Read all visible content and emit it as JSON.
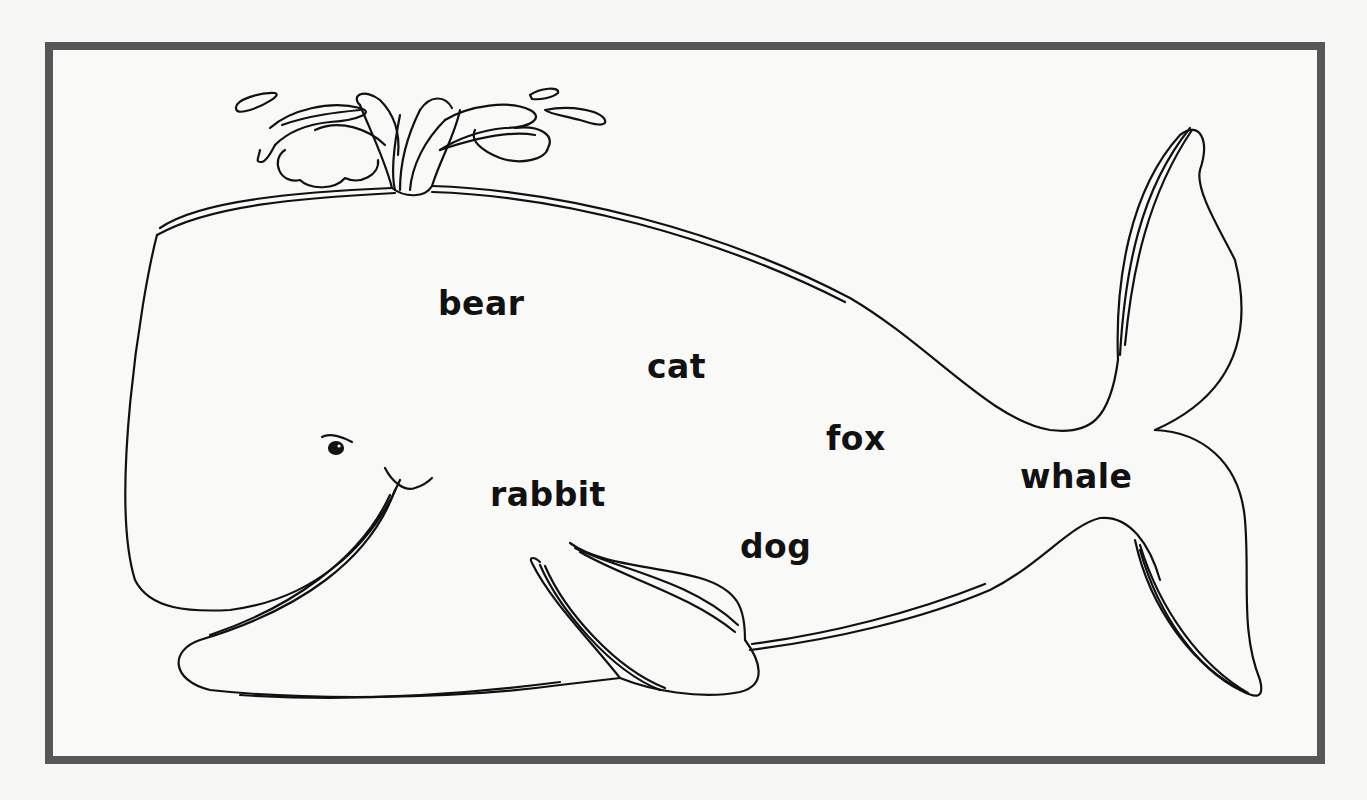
{
  "worksheet": {
    "frame_color": "#575757",
    "line_color": "#111111",
    "background": "#f7f7f6",
    "illustration": "whale",
    "words": [
      {
        "id": "bear",
        "text": "bear",
        "x": 438,
        "y": 287
      },
      {
        "id": "cat",
        "text": "cat",
        "x": 647,
        "y": 350
      },
      {
        "id": "fox",
        "text": "fox",
        "x": 826,
        "y": 422
      },
      {
        "id": "rabbit",
        "text": "rabbit",
        "x": 490,
        "y": 478
      },
      {
        "id": "dog",
        "text": "dog",
        "x": 740,
        "y": 530
      },
      {
        "id": "whale",
        "text": "whale",
        "x": 1020,
        "y": 460
      }
    ]
  }
}
